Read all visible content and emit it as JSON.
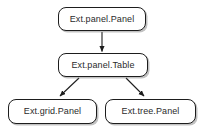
{
  "diagram": {
    "type": "class-hierarchy",
    "background_color": "#ffffff",
    "border_color": "#1d1d1d",
    "text_color": "#2b2b2b",
    "nodes": [
      {
        "id": "panel-panel",
        "label": "Ext.panel.Panel"
      },
      {
        "id": "panel-table",
        "label": "Ext.panel.Table"
      },
      {
        "id": "grid-panel",
        "label": "Ext.grid.Panel"
      },
      {
        "id": "tree-panel",
        "label": "Ext.tree.Panel"
      }
    ],
    "edges": [
      {
        "from": "panel-panel",
        "to": "panel-table",
        "style": "arrow-down"
      },
      {
        "from": "panel-table",
        "to": "grid-panel",
        "style": "arrow-diagonal-left"
      },
      {
        "from": "panel-table",
        "to": "tree-panel",
        "style": "arrow-diagonal-right"
      }
    ]
  }
}
